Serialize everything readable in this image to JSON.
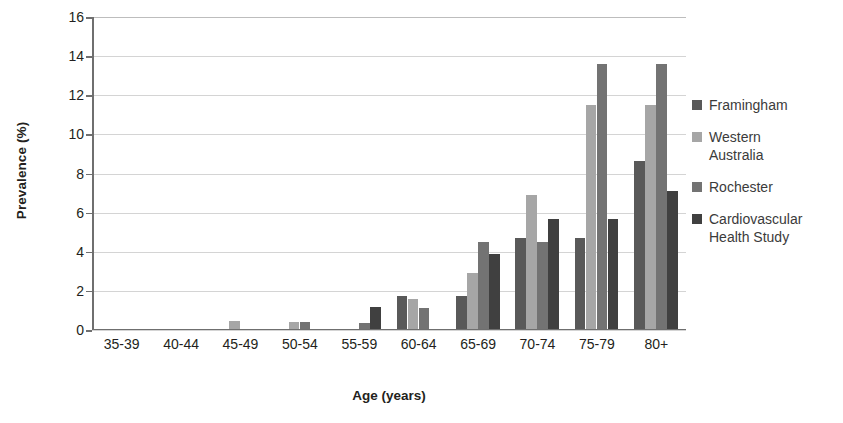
{
  "chart_data": {
    "type": "bar",
    "title": "",
    "xlabel": "Age (years)",
    "ylabel": "Prevalence (%)",
    "ylim": [
      0,
      16
    ],
    "ytick_step": 2,
    "yticks": [
      0,
      2,
      4,
      6,
      8,
      10,
      12,
      14,
      16
    ],
    "grid": true,
    "legend_position": "right",
    "categories": [
      "35-39",
      "40-44",
      "45-49",
      "50-54",
      "55-59",
      "60-64",
      "65-69",
      "70-74",
      "75-79",
      "80+"
    ],
    "series": [
      {
        "name": "Framingham",
        "color": "#595959",
        "values": [
          0,
          0,
          0,
          0,
          0,
          1.75,
          1.75,
          4.7,
          4.7,
          8.65
        ]
      },
      {
        "name": "Western Australia",
        "color": "#a6a6a6",
        "values": [
          0,
          0.05,
          0.45,
          0.4,
          0,
          1.6,
          2.9,
          6.9,
          11.5,
          11.5
        ]
      },
      {
        "name": "Rochester",
        "color": "#737373",
        "values": [
          0,
          0,
          0,
          0.4,
          0.35,
          1.1,
          4.5,
          4.5,
          13.6,
          13.6
        ]
      },
      {
        "name": "Cardiovascular Health Study",
        "color": "#404040",
        "values": [
          0,
          0,
          0,
          0,
          1.2,
          0,
          3.9,
          5.7,
          5.7,
          7.1
        ]
      }
    ]
  },
  "legend": {
    "items": [
      {
        "label": "Framingham",
        "color": "#595959"
      },
      {
        "label": "Western\nAustralia",
        "color": "#a6a6a6"
      },
      {
        "label": "Rochester",
        "color": "#737373"
      },
      {
        "label": "Cardiovascular\nHealth Study",
        "color": "#404040"
      }
    ]
  },
  "axes": {
    "y_title": "Prevalence (%)",
    "x_title": "Age (years)"
  }
}
